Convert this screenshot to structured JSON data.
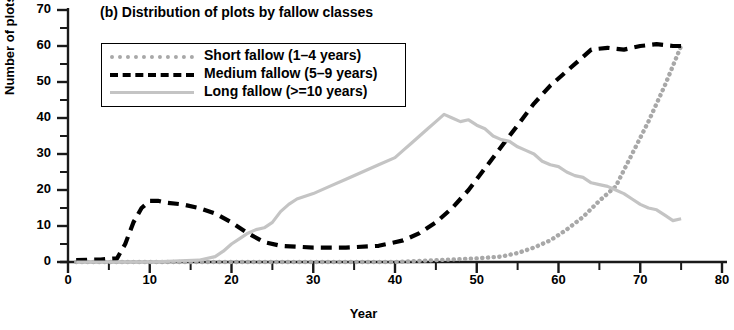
{
  "chart_data": {
    "type": "line",
    "title": "(b) Distribution of plots by fallow classes",
    "xlabel": "Year",
    "ylabel": "Number of plots",
    "xlim": [
      0,
      80
    ],
    "ylim": [
      0,
      70
    ],
    "xticks": [
      0,
      10,
      20,
      30,
      40,
      50,
      60,
      70,
      80
    ],
    "yticks": [
      0,
      10,
      20,
      30,
      40,
      50,
      60,
      70
    ],
    "x_minor_tick_step": 5,
    "y_minor_tick_step": 5,
    "grid": false,
    "legend_position": "upper-left-inside",
    "series": [
      {
        "name": "Short fallow (1–4 years)",
        "style": "dotted",
        "color": "#a8a8a8",
        "x": [
          1,
          5,
          10,
          15,
          20,
          25,
          30,
          35,
          40,
          45,
          50,
          53,
          55,
          57,
          59,
          61,
          63,
          65,
          67,
          69,
          71,
          73,
          75
        ],
        "values": [
          0,
          0,
          0,
          0,
          0,
          0,
          0,
          0,
          0,
          0.5,
          1,
          1.5,
          2.5,
          4,
          6,
          9,
          12.5,
          17,
          21,
          30,
          39,
          49,
          60
        ]
      },
      {
        "name": "Medium fallow (5–9 years)",
        "style": "dashed",
        "color": "#000000",
        "x": [
          1,
          4,
          6,
          7,
          8,
          9,
          10,
          11,
          12,
          14,
          16,
          18,
          20,
          22,
          24,
          26,
          30,
          34,
          38,
          41,
          43,
          45,
          47,
          49,
          51,
          53,
          55,
          57,
          59,
          61,
          63,
          64,
          66,
          68,
          70,
          72,
          74,
          75
        ],
        "values": [
          0.5,
          0.7,
          1,
          5,
          11,
          15,
          17,
          17,
          16.5,
          16,
          15,
          13.5,
          11,
          8,
          5.5,
          4.5,
          4,
          4,
          4.5,
          6,
          8,
          11,
          15,
          20,
          26,
          32,
          38,
          44,
          49,
          53,
          57,
          59,
          59.5,
          59,
          60,
          60.5,
          60,
          60
        ]
      },
      {
        "name": "Long fallow (>=10 years)",
        "style": "solid",
        "color": "#c4c4c4",
        "x": [
          1,
          10,
          16,
          18,
          19,
          20,
          21,
          22,
          23,
          24,
          25,
          26,
          27,
          28,
          30,
          32,
          34,
          36,
          38,
          40,
          41,
          42,
          43,
          44,
          45,
          46,
          47,
          48,
          49,
          50,
          51,
          52,
          53,
          54,
          55,
          56,
          57,
          58,
          59,
          60,
          61,
          62,
          63,
          64,
          65,
          66,
          67,
          68,
          69,
          70,
          71,
          72,
          73,
          74,
          75
        ],
        "values": [
          0,
          0,
          0.5,
          1.5,
          3,
          5,
          6.5,
          8,
          9,
          9.5,
          11,
          14,
          16,
          17.5,
          19,
          21,
          23,
          25,
          27,
          29,
          31,
          33,
          35,
          37,
          39,
          41,
          40,
          39,
          39.5,
          38,
          37,
          35,
          34,
          33.5,
          32,
          31,
          30,
          28,
          27,
          26.5,
          25,
          24,
          23.5,
          22,
          21.5,
          21,
          20,
          19,
          17.5,
          16,
          15,
          14.5,
          13,
          11.5,
          12
        ]
      }
    ]
  }
}
